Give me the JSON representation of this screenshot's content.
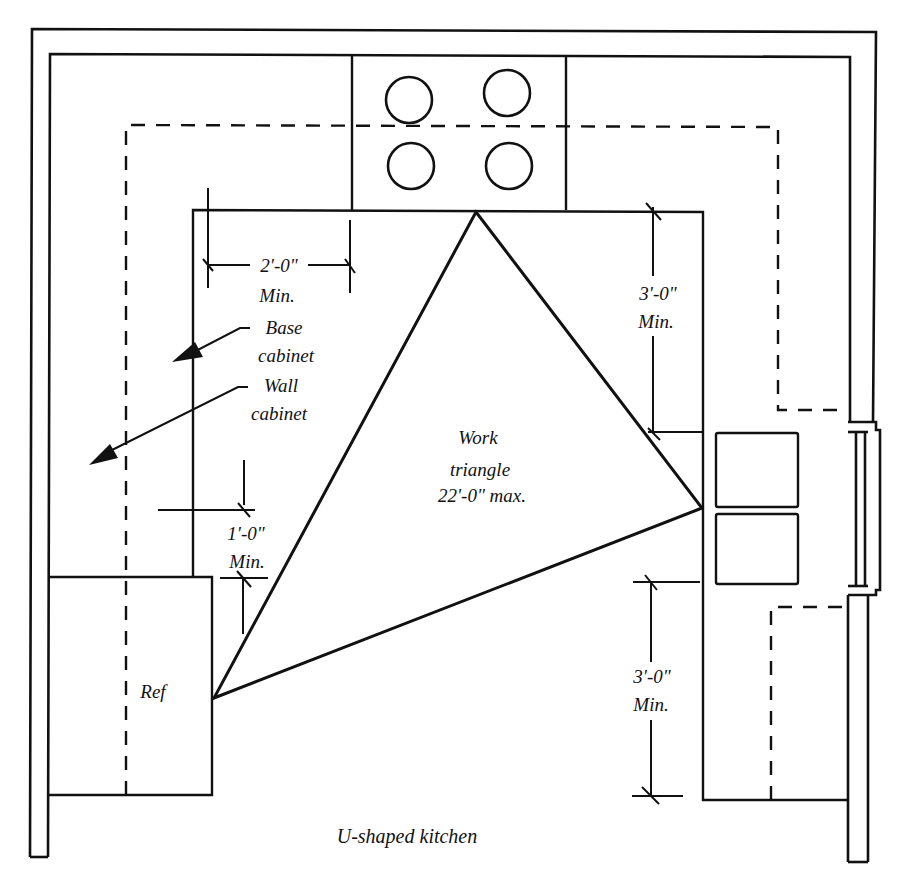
{
  "diagram": {
    "title": "U-shaped kitchen",
    "stroke_color": "#111111",
    "background_color": "#ffffff"
  },
  "labels": {
    "range_clearance_left": {
      "value": "2'-0\"",
      "qualifier": "Min."
    },
    "base_cabinet": {
      "line1": "Base",
      "line2": "cabinet"
    },
    "wall_cabinet": {
      "line1": "Wall",
      "line2": "cabinet"
    },
    "counter_clearance_ref": {
      "value": "1'-0\"",
      "qualifier": "Min."
    },
    "refrigerator": "Ref",
    "work_triangle": {
      "line1": "Work",
      "line2": "triangle",
      "line3": "22'-0\" max."
    },
    "sink_clearance_upper": {
      "value": "3'-0\"",
      "qualifier": "Min."
    },
    "sink_clearance_lower": {
      "value": "3'-0\"",
      "qualifier": "Min."
    },
    "caption": "U-shaped kitchen"
  },
  "elements": {
    "range": {
      "burners": 4
    },
    "sink": {
      "basins": 2
    },
    "window": {
      "panes": 3
    },
    "work_triangle_vertices": [
      "range",
      "sink",
      "refrigerator"
    ]
  }
}
